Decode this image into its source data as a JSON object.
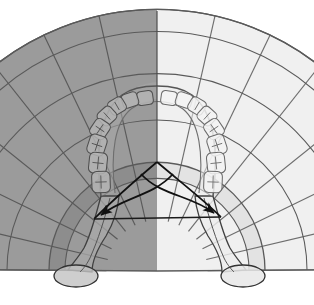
{
  "figure": {
    "type": "anatomical-diagram",
    "view": "occlusal",
    "width": 314,
    "height": 305,
    "background": "#ffffff"
  },
  "colors": {
    "fan_left_fill": "#9b9b9b",
    "fan_right_fill": "#f0f0f0",
    "band_left_fill": "#8d8d8d",
    "band_right_fill": "#e3e3e3",
    "arch_left_fill": "#a8a8a8",
    "arch_right_fill": "#efefef",
    "tooth_left_fill": "#b4b4b4",
    "tooth_right_fill": "#f3f3f3",
    "ramus_left_fill": "#aaaaaa",
    "ramus_right_fill": "#ededed",
    "condyle_left_fill": "#c2c2c2",
    "condyle_right_fill": "#e8e8e8",
    "stroke_light": "#6e6e6e",
    "stroke_mid": "#5a5a5a",
    "stroke_dark": "#1a1a1a",
    "arrow_color": "#111111",
    "midline": "#4d4d4d",
    "outline_color": "#555555"
  },
  "geometry": {
    "fan_apex": {
      "x": 157,
      "y": 271,
      "label": "radial-fan-apex"
    },
    "arch_apex": {
      "x": 157,
      "y": 162,
      "label": "gothic-arch-apex"
    },
    "fan_outer_radius": 262,
    "fan_inner_radius": 108,
    "fan_band_inner_radius": 92,
    "fan_top_y": 11,
    "fan_bottom_left": {
      "x": 14,
      "y": 272
    },
    "fan_bottom_right": {
      "x": 300,
      "y": 272
    },
    "sector_count": 14,
    "sector_angle_deg": 12.8,
    "midline_x": 157
  },
  "arrows": {
    "count": 2,
    "left": {
      "name": "left-condylar-arrow",
      "tip": {
        "x": 94,
        "y": 219
      },
      "origin": {
        "x": 157,
        "y": 162
      },
      "description": "curved arrow from gothic-arch apex to left condyle"
    },
    "right": {
      "name": "right-condylar-arrow",
      "tip": {
        "x": 221,
        "y": 217
      },
      "origin": {
        "x": 157,
        "y": 162
      },
      "description": "curved arrow from gothic-arch apex to right condyle"
    }
  },
  "condyles": {
    "left": {
      "name": "left-mandibular-condyle",
      "cx": 76,
      "cy": 276,
      "rx": 22,
      "ry": 11
    },
    "right": {
      "name": "right-mandibular-condyle",
      "cx": 243,
      "cy": 276,
      "rx": 22,
      "ry": 11
    }
  },
  "teeth": {
    "left_quadrant_count": 8,
    "right_quadrant_count": 8,
    "total": 16,
    "arrangement": "dental-arch-occlusal",
    "left": [
      {
        "idx": 0,
        "cx": 145,
        "cy": 98,
        "rx": 8.0,
        "ry": 7.0,
        "rot": -8
      },
      {
        "idx": 1,
        "cx": 130,
        "cy": 100,
        "rx": 8.0,
        "ry": 7.2,
        "rot": -18
      },
      {
        "idx": 2,
        "cx": 117,
        "cy": 106,
        "rx": 8.2,
        "ry": 7.6,
        "rot": -30
      },
      {
        "idx": 3,
        "cx": 107,
        "cy": 116,
        "rx": 8.6,
        "ry": 8.0,
        "rot": -42
      },
      {
        "idx": 4,
        "cx": 100,
        "cy": 129,
        "rx": 9.2,
        "ry": 8.4,
        "rot": -56
      },
      {
        "idx": 5,
        "cx": 97,
        "cy": 145,
        "rx": 10.0,
        "ry": 8.8,
        "rot": -72
      },
      {
        "idx": 6,
        "cx": 98,
        "cy": 163,
        "rx": 10.4,
        "ry": 9.0,
        "rot": -84
      },
      {
        "idx": 7,
        "cx": 101,
        "cy": 182,
        "rx": 10.6,
        "ry": 9.2,
        "rot": -92
      }
    ],
    "right": [
      {
        "idx": 0,
        "cx": 169,
        "cy": 98,
        "rx": 8.0,
        "ry": 7.0,
        "rot": 8
      },
      {
        "idx": 1,
        "cx": 184,
        "cy": 100,
        "rx": 8.0,
        "ry": 7.2,
        "rot": 18
      },
      {
        "idx": 2,
        "cx": 197,
        "cy": 106,
        "rx": 8.2,
        "ry": 7.6,
        "rot": 30
      },
      {
        "idx": 3,
        "cx": 207,
        "cy": 116,
        "rx": 8.6,
        "ry": 8.0,
        "rot": 42
      },
      {
        "idx": 4,
        "cx": 214,
        "cy": 129,
        "rx": 9.2,
        "ry": 8.4,
        "rot": 56
      },
      {
        "idx": 5,
        "cx": 217,
        "cy": 145,
        "rx": 10.0,
        "ry": 8.8,
        "rot": 72
      },
      {
        "idx": 6,
        "cx": 216,
        "cy": 163,
        "rx": 10.4,
        "ry": 9.0,
        "rot": 84
      },
      {
        "idx": 7,
        "cx": 213,
        "cy": 182,
        "rx": 10.6,
        "ry": 9.2,
        "rot": 92
      }
    ]
  },
  "labels": {
    "none_visible": "",
    "note": "This figure contains no rendered text labels."
  }
}
